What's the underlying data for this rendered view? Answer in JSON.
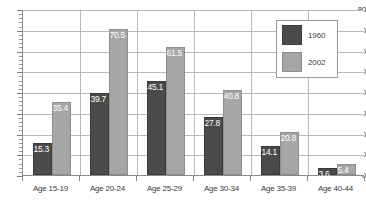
{
  "chart_data": {
    "type": "bar",
    "title": "",
    "xlabel": "",
    "ylabel": "",
    "ylim": [
      0,
      80
    ],
    "ytick_step": 10,
    "yticks": [
      0,
      10,
      20,
      30,
      40,
      50,
      60,
      70,
      80
    ],
    "ytick_labels": [
      "0",
      "10",
      "20",
      "30",
      "40",
      "50",
      "60",
      "70",
      "80"
    ],
    "grid": "horizontal-and-vertical",
    "legend_position": "top-right",
    "categories": [
      "Age 15-19",
      "Age 20-24",
      "Age 25-29",
      "Age 30-34",
      "Age 35-39",
      "Age 40-44"
    ],
    "series": [
      {
        "name": "1960",
        "color": "#4a4a4a",
        "values": [
          15.3,
          39.7,
          45.1,
          27.8,
          14.1,
          3.6
        ],
        "labels": [
          "15.3",
          "39.7",
          "45.1",
          "27.8",
          "14.1",
          "3.6"
        ]
      },
      {
        "name": "2002",
        "color": "#a6a6a6",
        "values": [
          35.4,
          70.5,
          61.5,
          40.8,
          20.8,
          5.4
        ],
        "labels": [
          "35.4",
          "70.5",
          "61.5",
          "40.8",
          "20.8",
          "5.4"
        ]
      }
    ],
    "data_labels_shown": true
  },
  "legend": {
    "entries": [
      {
        "label": "1960",
        "color": "#4a4a4a"
      },
      {
        "label": "2002",
        "color": "#a6a6a6"
      }
    ]
  },
  "colors": {
    "series_1960": "#4a4a4a",
    "series_2002": "#a6a6a6",
    "gridline": "#b9b9b9",
    "axis": "#8a8a8a",
    "text": "#3c3c3c",
    "background": "#ffffff"
  }
}
